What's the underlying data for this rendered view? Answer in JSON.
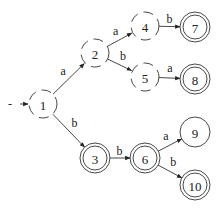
{
  "diagram": {
    "type": "finite-automaton",
    "colors": {
      "stroke": "#333333",
      "background": "#ffffff"
    },
    "nodes": [
      {
        "id": "1",
        "label": "1",
        "x": 43,
        "y": 104,
        "style": "dashed"
      },
      {
        "id": "2",
        "label": "2",
        "x": 95,
        "y": 53,
        "style": "dashed"
      },
      {
        "id": "4",
        "label": "4",
        "x": 145,
        "y": 26,
        "style": "dashed"
      },
      {
        "id": "5",
        "label": "5",
        "x": 145,
        "y": 77,
        "style": "dashed"
      },
      {
        "id": "7",
        "label": "7",
        "x": 195,
        "y": 27,
        "style": "double"
      },
      {
        "id": "8",
        "label": "8",
        "x": 195,
        "y": 79,
        "style": "double"
      },
      {
        "id": "3",
        "label": "3",
        "x": 95,
        "y": 158,
        "style": "double"
      },
      {
        "id": "6",
        "label": "6",
        "x": 145,
        "y": 158,
        "style": "double"
      },
      {
        "id": "9",
        "label": "9",
        "x": 195,
        "y": 132,
        "style": "single"
      },
      {
        "id": "10",
        "label": "10",
        "x": 195,
        "y": 185,
        "style": "double"
      }
    ],
    "start": {
      "marker": "-",
      "target": "1"
    },
    "edges": [
      {
        "from": "1",
        "to": "2",
        "label": "a"
      },
      {
        "from": "1",
        "to": "3",
        "label": "b"
      },
      {
        "from": "2",
        "to": "4",
        "label": "a"
      },
      {
        "from": "2",
        "to": "5",
        "label": "b"
      },
      {
        "from": "4",
        "to": "7",
        "label": "b"
      },
      {
        "from": "5",
        "to": "8",
        "label": "a"
      },
      {
        "from": "3",
        "to": "6",
        "label": "b"
      },
      {
        "from": "6",
        "to": "9",
        "label": "a"
      },
      {
        "from": "6",
        "to": "10",
        "label": "b"
      }
    ]
  }
}
